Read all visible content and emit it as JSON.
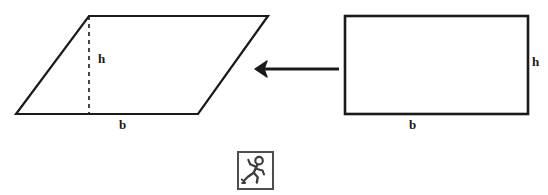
{
  "diagram": {
    "stroke_color": "#1a1a1a",
    "background_color": "#ffffff",
    "parallelogram": {
      "name": "parallelogram",
      "height_label": "h",
      "base_label": "b",
      "height_line_style": "dashed",
      "points": "16,114 89,16 268,16 198,114"
    },
    "rectangle": {
      "name": "rectangle",
      "height_label": "h",
      "base_label": "b",
      "x": 345,
      "y": 16,
      "width": 183,
      "height": 98
    },
    "arrow": {
      "name": "left-arrow",
      "direction": "left",
      "tip_x": 255,
      "tail_x": 339,
      "y": 69
    },
    "icon": {
      "name": "running-person-icon",
      "label": "running person",
      "border_color": "#4d4d4d"
    }
  }
}
